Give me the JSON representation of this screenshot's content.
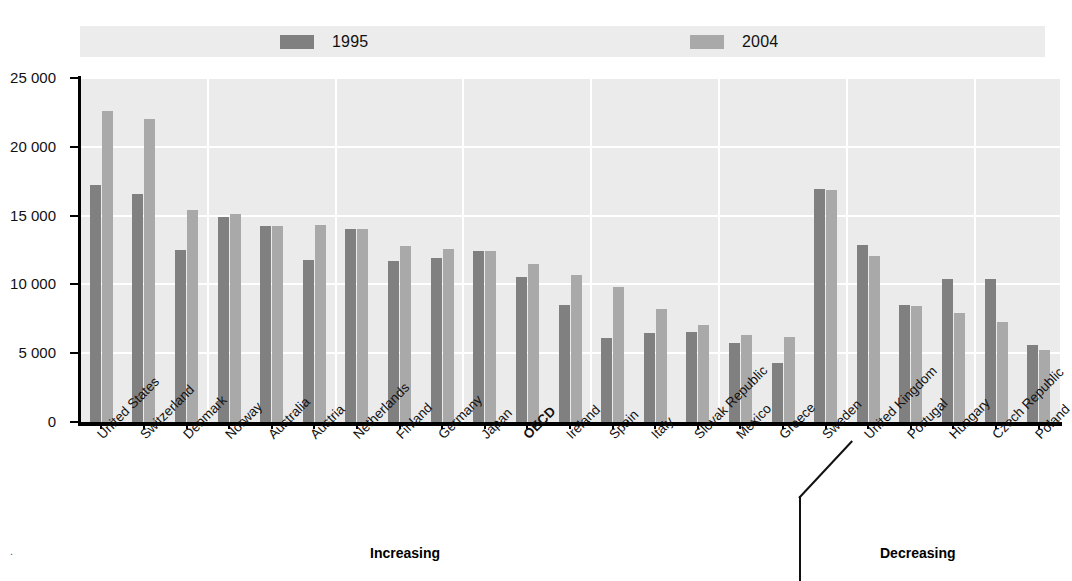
{
  "legend": {
    "items": [
      {
        "label": "1995",
        "color": "#808080",
        "name": "legend-1995"
      },
      {
        "label": "2004",
        "color": "#a9a9a9",
        "name": "legend-2004"
      }
    ]
  },
  "axis": {
    "y_ticks": [
      "0",
      "5 000",
      "10 000",
      "15 000",
      "20 000",
      "25 000"
    ],
    "y_min": 0,
    "y_max": 25000,
    "y_step": 5000
  },
  "sections": [
    {
      "label": "Increasing"
    },
    {
      "label": "Decreasing"
    }
  ],
  "chart_data": {
    "type": "bar",
    "title": "",
    "subtitle": "",
    "xlabel": "",
    "ylabel": "",
    "ylim": [
      0,
      25000
    ],
    "ytick_values": [
      0,
      5000,
      10000,
      15000,
      20000,
      25000
    ],
    "grid": true,
    "legend_position": "top",
    "categories": [
      "United States",
      "Switzerland",
      "Denmark",
      "Norway",
      "Australia",
      "Austria",
      "Netherlands",
      "Finland",
      "Germany",
      "Japan",
      "OECD",
      "Ireland",
      "Spain",
      "Italy",
      "Slovak Republic",
      "Mexico",
      "Greece",
      "Sweden",
      "United Kingdom",
      "Portugal",
      "Hungary",
      "Czech Republic",
      "Poland"
    ],
    "highlighted_categories": [
      "OECD"
    ],
    "series": [
      {
        "name": "1995",
        "color": "#808080",
        "values": [
          17200,
          16600,
          12500,
          14900,
          14250,
          11750,
          14000,
          11700,
          11900,
          12450,
          10550,
          8500,
          6100,
          6450,
          6550,
          5750,
          4300,
          16900,
          12900,
          8500,
          10400,
          10400,
          5600
        ]
      },
      {
        "name": "2004",
        "color": "#a9a9a9",
        "values": [
          22600,
          22050,
          15400,
          15150,
          14250,
          14300,
          14050,
          12800,
          12550,
          12450,
          11500,
          10700,
          9800,
          8200,
          7050,
          6300,
          6200,
          16850,
          12100,
          8400,
          7900,
          7300,
          5200
        ]
      }
    ],
    "group_split": {
      "after_category": "Greece",
      "left_label": "Increasing",
      "right_label": "Decreasing"
    }
  }
}
